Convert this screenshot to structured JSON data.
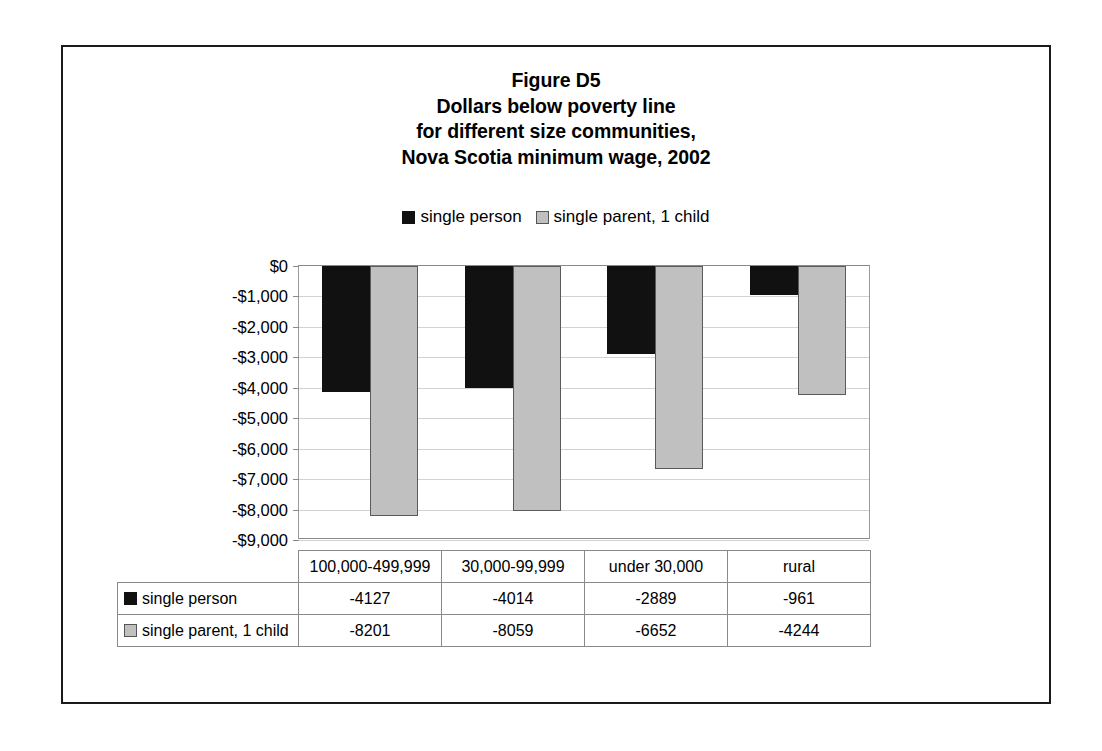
{
  "figure": {
    "title_lines": [
      "Figure D5",
      "Dollars below poverty line",
      "for different size communities,",
      "Nova Scotia minimum wage, 2002"
    ]
  },
  "legend": {
    "entries": [
      {
        "label": "single person",
        "swatch": "dark-square-swatch",
        "color": "#111111"
      },
      {
        "label": "single parent, 1 child",
        "swatch": "light-square-swatch",
        "color": "#c0c0c0"
      }
    ]
  },
  "axis": {
    "ticks": [
      "$0",
      "-$1,000",
      "-$2,000",
      "-$3,000",
      "-$4,000",
      "-$5,000",
      "-$6,000",
      "-$7,000",
      "-$8,000",
      "-$9,000"
    ]
  },
  "table": {
    "corner": "",
    "headers": [
      "100,000-499,999",
      "30,000-99,999",
      "under 30,000",
      "rural"
    ],
    "rows": [
      {
        "label": "single person",
        "swatch": "dark-square-swatch",
        "values": [
          "-4127",
          "-4014",
          "-2889",
          "-961"
        ]
      },
      {
        "label": "single parent, 1 child",
        "swatch": "light-square-swatch",
        "values": [
          "-8201",
          "-8059",
          "-6652",
          "-4244"
        ]
      }
    ]
  },
  "chart_data": {
    "type": "bar",
    "xlabel": "",
    "ylabel": "",
    "categories": [
      "100,000-499,999",
      "30,000-99,999",
      "under 30,000",
      "rural"
    ],
    "series": [
      {
        "name": "single person",
        "color": "#111111",
        "values": [
          -4127,
          -4014,
          -2889,
          -961
        ]
      },
      {
        "name": "single parent, 1 child",
        "color": "#c0c0c0",
        "values": [
          -8201,
          -8059,
          -6652,
          -4244
        ]
      }
    ],
    "ylim": [
      -9000,
      0
    ],
    "ytick_step": 1000,
    "ytick_labels": [
      "$0",
      "-$1,000",
      "-$2,000",
      "-$3,000",
      "-$4,000",
      "-$5,000",
      "-$6,000",
      "-$7,000",
      "-$8,000",
      "-$9,000"
    ],
    "grid": true,
    "legend_position": "top-center",
    "orientation": "vertical-downward",
    "currency": "CAD dollars"
  }
}
